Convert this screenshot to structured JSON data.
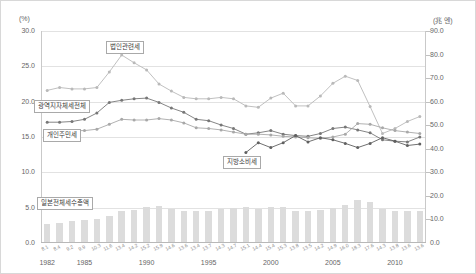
{
  "axes": {
    "left_unit": "(%)",
    "right_unit": "(兆 엔)",
    "left_ticks": [
      "30.0",
      "25.0",
      "20.0",
      "15.0",
      "10.0",
      "5.0",
      "0.0"
    ],
    "right_ticks": [
      "90.0",
      "80.0",
      "70.0",
      "60.0",
      "50.0",
      "40.0",
      "30.0",
      "20.0",
      "10.0",
      "0.0"
    ],
    "x_ticks": [
      "1982",
      "1985",
      "1990",
      "1995",
      "2000",
      "2005",
      "2010"
    ]
  },
  "labels": {
    "corporate_tax": "법인관련세",
    "metro_total": "광역지자체세전체",
    "individual_resident_tax": "개인주민세",
    "local_consumption_tax": "지방소비세",
    "japan_total_tax_revenue": "일본전체세수총액"
  },
  "chart_data": {
    "type": "line",
    "title": "",
    "xlabel": "",
    "ylabel": "(%)",
    "ylim": [
      0,
      30
    ],
    "y2lim": [
      0,
      90
    ],
    "grid": true,
    "legend": "callouts",
    "x": [
      1982,
      1983,
      1984,
      1985,
      1986,
      1987,
      1988,
      1989,
      1990,
      1991,
      1992,
      1993,
      1994,
      1995,
      1996,
      1997,
      1998,
      1999,
      2000,
      2001,
      2002,
      2003,
      2004,
      2005,
      2006,
      2007,
      2008,
      2009,
      2010,
      2011,
      2012
    ],
    "series": [
      {
        "name": "법인관련세",
        "axis": "left",
        "color": "#b9b9b9",
        "values": [
          21.6,
          22.0,
          21.8,
          21.8,
          22.0,
          24.2,
          26.6,
          25.5,
          24.5,
          22.5,
          21.5,
          20.6,
          20.4,
          20.4,
          20.6,
          20.4,
          19.4,
          19.2,
          20.5,
          21.2,
          19.4,
          19.4,
          20.8,
          22.6,
          23.6,
          23.0,
          19.3,
          15.5,
          16.2,
          17.2,
          17.9
        ]
      },
      {
        "name": "광역지자체세전체",
        "axis": "left",
        "color": "#777777",
        "values": [
          17.1,
          17.1,
          17.2,
          17.5,
          18.4,
          19.9,
          20.2,
          20.4,
          20.5,
          19.9,
          19.1,
          18.5,
          17.5,
          17.3,
          16.7,
          16.2,
          15.4,
          15.6,
          15.9,
          15.4,
          15.2,
          15.1,
          15.5,
          16.2,
          16.4,
          16.0,
          15.6,
          14.6,
          14.4,
          14.3,
          15.0
        ]
      },
      {
        "name": "개인주민세",
        "axis": "left",
        "color": "#a8a8a8",
        "values": [
          15.7,
          15.8,
          15.9,
          15.9,
          16.1,
          16.8,
          17.5,
          17.4,
          17.4,
          17.6,
          17.4,
          17.0,
          16.3,
          16.2,
          16.0,
          15.7,
          15.4,
          15.4,
          15.3,
          15.1,
          15.0,
          14.9,
          14.8,
          15.0,
          15.4,
          16.9,
          16.8,
          16.3,
          15.9,
          15.7,
          15.5
        ]
      },
      {
        "name": "지방소비세",
        "axis": "left",
        "color": "#606060",
        "values": [
          null,
          null,
          null,
          null,
          null,
          null,
          null,
          null,
          null,
          null,
          null,
          null,
          null,
          null,
          null,
          null,
          12.8,
          14.2,
          13.5,
          14.2,
          15.2,
          14.3,
          14.9,
          14.6,
          14.1,
          13.5,
          14.1,
          14.9,
          14.4,
          13.8,
          14.0
        ]
      }
    ],
    "bars": {
      "name": "일본전체세수총액",
      "axis": "right",
      "color": "#dcdcdc",
      "unit": "兆円",
      "values": [
        8.1,
        8.4,
        9.2,
        9.9,
        10.3,
        11.6,
        13.4,
        14.2,
        15.2,
        15.9,
        14.6,
        13.6,
        13.4,
        13.7,
        14.3,
        14.7,
        15.1,
        14.4,
        15.4,
        15.3,
        13.8,
        13.5,
        14.2,
        14.9,
        16.0,
        18.3,
        17.6,
        14.3,
        13.8,
        13.6,
        13.6
      ]
    }
  }
}
